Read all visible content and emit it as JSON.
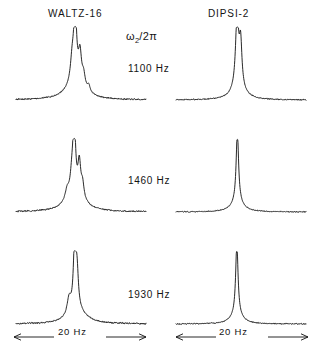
{
  "figure": {
    "width": 315,
    "height": 350,
    "background": "#ffffff",
    "ink_color": "#111111"
  },
  "columns": [
    {
      "id": "waltz",
      "label": "WALTZ-16"
    },
    {
      "id": "dipsi",
      "label": "DIPSI-2"
    }
  ],
  "center_annotation": {
    "omega_symbol": "ω",
    "omega_subscript": "2",
    "omega_rest": "/2π"
  },
  "rows": [
    {
      "id": "row-1100",
      "frequency_label": "1100 Hz"
    },
    {
      "id": "row-1460",
      "frequency_label": "1460 Hz"
    },
    {
      "id": "row-1930",
      "frequency_label": "1930 Hz"
    }
  ],
  "scale_bars": [
    {
      "id": "scale-left",
      "label": "20 Hz"
    },
    {
      "id": "scale-right",
      "label": "20 Hz"
    }
  ],
  "chart_data": {
    "type": "line",
    "title": "",
    "xlabel": "ω₂/2π",
    "ylabel": "",
    "grid": false,
    "legend": "none",
    "axis_span_hz": 20,
    "panels": [
      {
        "column": "WALTZ-16",
        "row": "1100 Hz",
        "baseline_noise": 0.012,
        "peaks": [
          {
            "center": 0.455,
            "height": 1.0,
            "width": 0.013
          },
          {
            "center": 0.432,
            "height": 0.3,
            "width": 0.016
          },
          {
            "center": 0.492,
            "height": 0.42,
            "width": 0.014
          },
          {
            "center": 0.52,
            "height": 0.17,
            "width": 0.014
          },
          {
            "center": 0.56,
            "height": 0.09,
            "width": 0.012
          },
          {
            "center": 0.455,
            "height": 0.22,
            "width": 0.085
          }
        ]
      },
      {
        "column": "DIPSI-2",
        "row": "1100 Hz",
        "baseline_noise": 0.01,
        "peaks": [
          {
            "center": 0.47,
            "height": 1.0,
            "width": 0.014
          },
          {
            "center": 0.497,
            "height": 0.6,
            "width": 0.012
          },
          {
            "center": 0.48,
            "height": 0.16,
            "width": 0.06
          }
        ]
      },
      {
        "column": "WALTZ-16",
        "row": "1460 Hz",
        "baseline_noise": 0.012,
        "peaks": [
          {
            "center": 0.448,
            "height": 1.0,
            "width": 0.012
          },
          {
            "center": 0.43,
            "height": 0.26,
            "width": 0.016
          },
          {
            "center": 0.487,
            "height": 0.46,
            "width": 0.013
          },
          {
            "center": 0.512,
            "height": 0.2,
            "width": 0.013
          },
          {
            "center": 0.393,
            "height": 0.14,
            "width": 0.018
          },
          {
            "center": 0.455,
            "height": 0.2,
            "width": 0.09
          }
        ]
      },
      {
        "column": "DIPSI-2",
        "row": "1460 Hz",
        "baseline_noise": 0.009,
        "peaks": [
          {
            "center": 0.472,
            "height": 1.0,
            "width": 0.011
          },
          {
            "center": 0.472,
            "height": 0.13,
            "width": 0.055
          }
        ]
      },
      {
        "column": "WALTZ-16",
        "row": "1930 Hz",
        "baseline_noise": 0.013,
        "peaks": [
          {
            "center": 0.452,
            "height": 1.0,
            "width": 0.012
          },
          {
            "center": 0.47,
            "height": 0.44,
            "width": 0.012
          },
          {
            "center": 0.408,
            "height": 0.22,
            "width": 0.018
          },
          {
            "center": 0.47,
            "height": 0.17,
            "width": 0.085
          }
        ]
      },
      {
        "column": "DIPSI-2",
        "row": "1930 Hz",
        "baseline_noise": 0.01,
        "peaks": [
          {
            "center": 0.468,
            "height": 1.0,
            "width": 0.011
          },
          {
            "center": 0.468,
            "height": 0.12,
            "width": 0.055
          }
        ]
      }
    ]
  },
  "layout": {
    "panel_left_x": 16,
    "panel_right_x": 176,
    "panel_width": 130,
    "row_baselines": [
      100,
      212,
      324
    ],
    "trace_height": 72,
    "scale_bar_y": 337,
    "scale_bar_left": {
      "x1": 14,
      "x2": 146
    },
    "scale_bar_right": {
      "x1": 176,
      "x2": 308
    }
  }
}
